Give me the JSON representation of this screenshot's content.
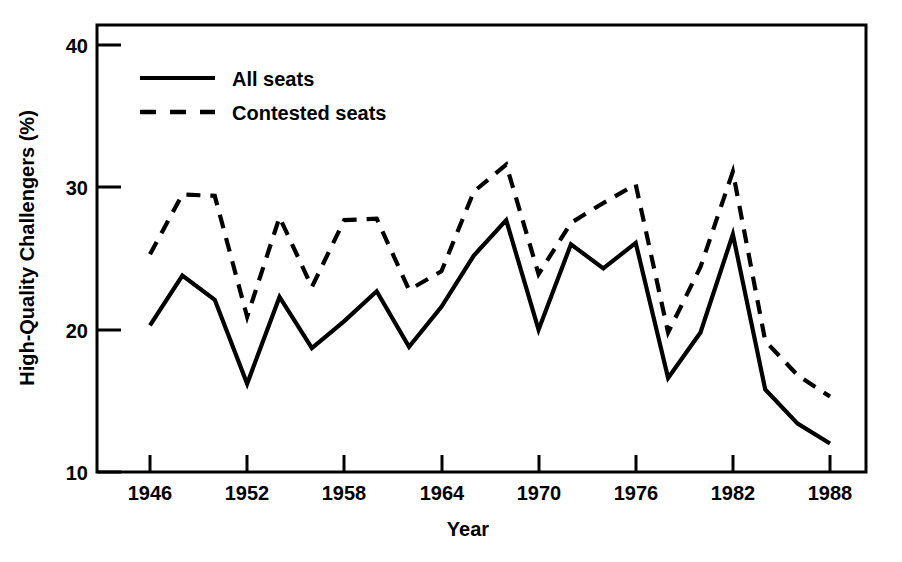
{
  "chart_data": {
    "type": "line",
    "title": "",
    "subtitle": "",
    "xlabel": "Year",
    "ylabel": "High-Quality Challengers (%)",
    "xlim": [
      1944,
      1989
    ],
    "ylim": [
      8.5,
      41.8
    ],
    "grid": false,
    "legend_position": "top-left inside axes",
    "x_tick_labels": [
      "1946",
      "1952",
      "1958",
      "1964",
      "1970",
      "1976",
      "1982",
      "1988"
    ],
    "x_tick_values": [
      1946,
      1952,
      1958,
      1964,
      1970,
      1976,
      1982,
      1988
    ],
    "y_tick_labels": [
      "10",
      "20",
      "30",
      "40"
    ],
    "y_tick_values": [
      10,
      20,
      30,
      40
    ],
    "x": [
      1946,
      1948,
      1950,
      1952,
      1954,
      1956,
      1958,
      1960,
      1962,
      1964,
      1966,
      1968,
      1970,
      1972,
      1974,
      1976,
      1978,
      1980,
      1982,
      1984,
      1986,
      1988
    ],
    "series": [
      {
        "name": "All seats",
        "style": "solid",
        "values": [
          20.3,
          23.8,
          22.1,
          16.2,
          22.3,
          18.7,
          20.6,
          22.7,
          18.8,
          21.6,
          25.2,
          27.7,
          20.0,
          26.0,
          24.3,
          26.1,
          16.6,
          19.8,
          26.7,
          15.8,
          13.4,
          12.0
        ]
      },
      {
        "name": "Contested seats",
        "style": "dashed",
        "values": [
          25.3,
          29.5,
          29.4,
          20.9,
          27.9,
          23.0,
          27.7,
          27.8,
          22.8,
          24.1,
          29.7,
          31.6,
          23.9,
          27.5,
          28.9,
          30.2,
          19.8,
          24.4,
          31.1,
          19.2,
          16.8,
          15.3
        ]
      }
    ],
    "annotations": []
  },
  "axes": {
    "y_axis_title": "High-Quality Challengers (%)",
    "x_axis_title": "Year",
    "y_ticks": [
      {
        "label": "40",
        "value": 40
      },
      {
        "label": "30",
        "value": 30
      },
      {
        "label": "20",
        "value": 20
      },
      {
        "label": "10",
        "value": 10
      }
    ],
    "x_ticks": [
      {
        "label": "1946",
        "value": 1946
      },
      {
        "label": "1952",
        "value": 1952
      },
      {
        "label": "1958",
        "value": 1958
      },
      {
        "label": "1964",
        "value": 1964
      },
      {
        "label": "1970",
        "value": 1970
      },
      {
        "label": "1976",
        "value": 1976
      },
      {
        "label": "1982",
        "value": 1982
      },
      {
        "label": "1988",
        "value": 1988
      }
    ]
  },
  "legend": {
    "items": [
      {
        "label": "All seats",
        "style": "solid"
      },
      {
        "label": "Contested seats",
        "style": "dashed"
      }
    ]
  },
  "colors": {
    "background": "#ffffff",
    "foreground": "#000000",
    "series_all_seats": "#000000",
    "series_contested_seats": "#000000"
  }
}
